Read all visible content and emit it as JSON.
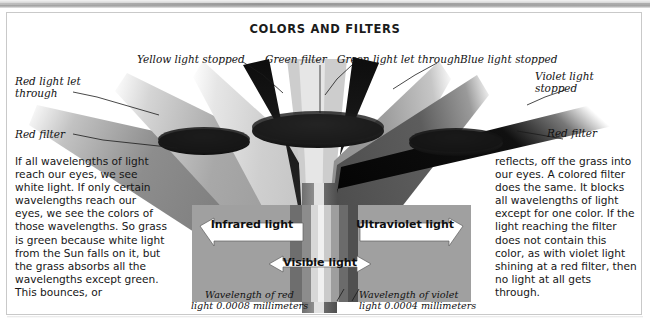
{
  "figure": {
    "title": "COLORS AND FILTERS"
  },
  "callouts": [
    {
      "id": "red-light-let-through",
      "text": "Red light let\nthrough"
    },
    {
      "id": "red-filter-left",
      "text": "Red filter"
    },
    {
      "id": "yellow-light-stopped",
      "text": "Yellow light stopped"
    },
    {
      "id": "green-filter",
      "text": "Green filter"
    },
    {
      "id": "green-light-let-through",
      "text": "Green light let through"
    },
    {
      "id": "blue-light-stopped",
      "text": "Blue light stopped"
    },
    {
      "id": "violet-light-stopped",
      "text": "Violet light\nstopped"
    },
    {
      "id": "red-filter-right",
      "text": "Red filter"
    }
  ],
  "spectrum": {
    "bands": [
      {
        "name": "infrared-left",
        "color": "#9a9a9a"
      },
      {
        "name": "deep-red",
        "color": "#6e6e6e"
      },
      {
        "name": "red",
        "color": "#8a8a8a"
      },
      {
        "name": "orange-yellow",
        "color": "#d6d6d6"
      },
      {
        "name": "yellow-green",
        "color": "#efefef"
      },
      {
        "name": "green",
        "color": "#c9c9c9"
      },
      {
        "name": "blue",
        "color": "#9d9d9d"
      },
      {
        "name": "indigo",
        "color": "#6a6a6a"
      },
      {
        "name": "violet",
        "color": "#4f4f4f"
      },
      {
        "name": "ultraviolet-right",
        "color": "#9a9a9a"
      }
    ],
    "arrows": [
      {
        "id": "infrared-light",
        "label": "Infrared light"
      },
      {
        "id": "ultraviolet-light",
        "label": "Ultraviolet light"
      },
      {
        "id": "visible-light",
        "label": "Visible light"
      }
    ],
    "captions": [
      {
        "id": "wavelength-red",
        "text": "Wavelength of red\nlight 0.0008 millimeters"
      },
      {
        "id": "wavelength-violet",
        "text": "Wavelength of violet\nlight 0.0004 millimeters"
      }
    ]
  },
  "body": {
    "left": "If all wavelengths of light reach our eyes, we see white light. If only certain wavelengths reach our eyes, we see the colors of those wavelengths. So grass is green because white light from the Sun falls on it, but the grass absorbs all the wavelengths except green. This bounces, or",
    "right": "reflects, off the grass into our eyes. A colored filter does the same. It blocks all wavelengths of light except for one color. If the light reaching the filter does not contain this color, as with violet light shining at a red filter, then no light at all gets through."
  }
}
